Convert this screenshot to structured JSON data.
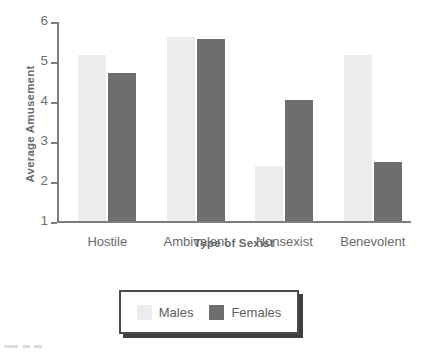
{
  "chart_data": {
    "type": "bar",
    "title": "",
    "xlabel": "Type of Sexist",
    "ylabel": "Average Amusement",
    "categories": [
      "Hostile",
      "Ambivalent",
      "Nonsexist",
      "Benevolent"
    ],
    "series": [
      {
        "name": "Males",
        "color": "#ececec",
        "values": [
          5.15,
          5.6,
          2.38,
          5.15
        ]
      },
      {
        "name": "Females",
        "color": "#6e6e6e",
        "values": [
          4.7,
          5.55,
          4.02,
          2.47
        ]
      }
    ],
    "ylim": [
      1,
      6
    ],
    "yticks": [
      1,
      2,
      3,
      4,
      5,
      6
    ],
    "ytick_labels": [
      "1",
      "2",
      "3",
      "4",
      "5",
      "6"
    ],
    "grid": false,
    "legend_position": "bottom-center"
  },
  "axes": {
    "y_title": "Average Amusement",
    "x_title": "Type of Sexist"
  },
  "legend": {
    "entries": [
      {
        "label": "Males"
      },
      {
        "label": "Females"
      }
    ]
  }
}
